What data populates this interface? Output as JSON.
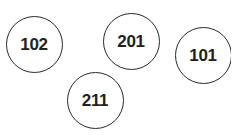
{
  "diagram": {
    "width": 231,
    "height": 135,
    "stroke_color": "#2a2a2a",
    "text_color": "#222222",
    "nodes": [
      {
        "label": "102",
        "cx": 34,
        "cy": 44,
        "r": 28.5
      },
      {
        "label": "201",
        "cx": 131,
        "cy": 41,
        "r": 28.5
      },
      {
        "label": "101",
        "cx": 203,
        "cy": 55,
        "r": 28.5
      },
      {
        "label": "211",
        "cx": 95,
        "cy": 100,
        "r": 28.5
      }
    ]
  }
}
